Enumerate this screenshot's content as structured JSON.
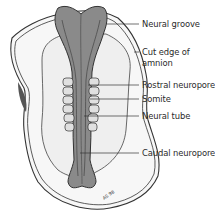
{
  "figure": {
    "type": "embryo-dorsal-view",
    "colors": {
      "neural_fill": "#8a8a8a",
      "neural_dark": "#5e5e5e",
      "amnion_fill": "#f4f4f4",
      "outline": "#333333",
      "somite_fill": "#dedede"
    },
    "signature": "AS 98"
  },
  "labels": [
    {
      "id": "neural-groove",
      "text": "Neural groove",
      "y": 19,
      "line_from_x": 106,
      "line_y": 24
    },
    {
      "id": "cut-edge-amnion-1",
      "text": "Cut edge of",
      "y": 47,
      "line_from_x": 134,
      "line_y": 52
    },
    {
      "id": "cut-edge-amnion-2",
      "text": "amnion",
      "y": 58
    },
    {
      "id": "rostral-neuropore",
      "text": "Rostral neuropore",
      "y": 80,
      "line_from_x": 88,
      "line_y": 85
    },
    {
      "id": "somite",
      "text": "Somite",
      "y": 94,
      "line_from_x": 90,
      "line_y": 99
    },
    {
      "id": "neural-tube",
      "text": "Neural tube",
      "y": 111,
      "line_from_x": 84,
      "line_y": 116
    },
    {
      "id": "caudal-neuropore",
      "text": "Caudal neuropore",
      "y": 148,
      "line_from_x": 80,
      "line_y": 153
    }
  ]
}
